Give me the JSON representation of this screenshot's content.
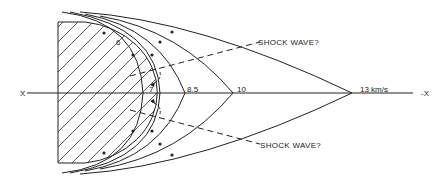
{
  "diagram": {
    "axis": {
      "left_label": "X",
      "right_label": "-X"
    },
    "shock_labels": {
      "upper": "SHOCK WAVE?",
      "lower": "SHOCK WAVE?"
    },
    "velocity_labels": [
      {
        "id": "v6",
        "text": "6"
      },
      {
        "id": "v7",
        "text": "7"
      },
      {
        "id": "v85",
        "text": "8.5"
      },
      {
        "id": "v10",
        "text": "10"
      },
      {
        "id": "v13",
        "text": "13 km/s"
      }
    ],
    "colors": {
      "line": "#222222",
      "background": "#ffffff"
    }
  }
}
